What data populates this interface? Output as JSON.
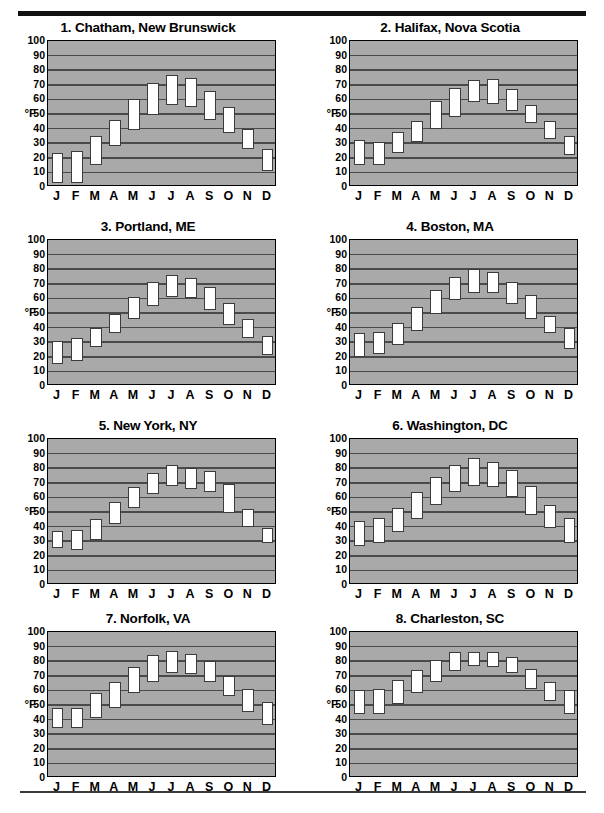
{
  "page": {
    "axis_unit_label": "°F",
    "y_ticks": [
      0,
      10,
      20,
      30,
      40,
      50,
      60,
      70,
      80,
      90,
      100
    ],
    "x_ticks": [
      "J",
      "F",
      "M",
      "A",
      "M",
      "J",
      "J",
      "A",
      "S",
      "O",
      "N",
      "D"
    ],
    "plot_background_color": "#a9a9a9",
    "gridline_color": "#4a4a4a",
    "box_fill_color": "#ffffff",
    "box_border_color": "#3b3b3b",
    "rule_color": "#111111"
  },
  "chart_data": [
    {
      "type": "bar",
      "title": "1. Chatham, New Brunswick",
      "index": 1,
      "xlabel": "",
      "ylabel": "°F",
      "ylim": [
        0,
        100
      ],
      "grid": true,
      "categories": [
        "J",
        "F",
        "M",
        "A",
        "M",
        "J",
        "J",
        "A",
        "S",
        "O",
        "N",
        "D"
      ],
      "series": [
        {
          "name": "low",
          "values": [
            3,
            3,
            15,
            28,
            39,
            49,
            56,
            55,
            46,
            37,
            26,
            11
          ]
        },
        {
          "name": "high",
          "values": [
            23,
            25,
            35,
            46,
            60,
            71,
            77,
            75,
            66,
            55,
            40,
            26
          ]
        }
      ]
    },
    {
      "type": "bar",
      "title": "2. Halifax, Nova Scotia",
      "index": 2,
      "xlabel": "",
      "ylabel": "°F",
      "ylim": [
        0,
        100
      ],
      "grid": true,
      "categories": [
        "J",
        "F",
        "M",
        "A",
        "M",
        "J",
        "J",
        "A",
        "S",
        "O",
        "N",
        "D"
      ],
      "series": [
        {
          "name": "low",
          "values": [
            15,
            15,
            23,
            31,
            40,
            48,
            58,
            57,
            52,
            44,
            33,
            22
          ]
        },
        {
          "name": "high",
          "values": [
            32,
            31,
            38,
            45,
            59,
            68,
            73,
            74,
            67,
            56,
            45,
            35
          ]
        }
      ]
    },
    {
      "type": "bar",
      "title": "3. Portland, ME",
      "index": 3,
      "xlabel": "",
      "ylabel": "°F",
      "ylim": [
        0,
        100
      ],
      "grid": true,
      "categories": [
        "J",
        "F",
        "M",
        "A",
        "M",
        "J",
        "J",
        "A",
        "S",
        "O",
        "N",
        "D"
      ],
      "series": [
        {
          "name": "low",
          "values": [
            15,
            17,
            27,
            36,
            46,
            55,
            61,
            60,
            52,
            42,
            33,
            21
          ]
        },
        {
          "name": "high",
          "values": [
            31,
            33,
            40,
            49,
            61,
            71,
            76,
            74,
            68,
            57,
            46,
            34
          ]
        }
      ]
    },
    {
      "type": "bar",
      "title": "4. Boston, MA",
      "index": 4,
      "xlabel": "",
      "ylabel": "°F",
      "ylim": [
        0,
        100
      ],
      "grid": true,
      "categories": [
        "J",
        "F",
        "M",
        "A",
        "M",
        "J",
        "J",
        "A",
        "S",
        "O",
        "N",
        "D"
      ],
      "series": [
        {
          "name": "low",
          "values": [
            20,
            22,
            28,
            38,
            49,
            59,
            64,
            64,
            56,
            46,
            36,
            25
          ]
        },
        {
          "name": "high",
          "values": [
            36,
            37,
            43,
            54,
            66,
            75,
            80,
            78,
            71,
            62,
            48,
            40
          ]
        }
      ]
    },
    {
      "type": "bar",
      "title": "5. New York, NY",
      "index": 5,
      "xlabel": "",
      "ylabel": "°F",
      "ylim": [
        0,
        100
      ],
      "grid": true,
      "categories": [
        "J",
        "F",
        "M",
        "A",
        "M",
        "J",
        "J",
        "A",
        "S",
        "O",
        "N",
        "D"
      ],
      "series": [
        {
          "name": "low",
          "values": [
            25,
            24,
            31,
            42,
            53,
            62,
            68,
            66,
            64,
            49,
            40,
            29
          ]
        },
        {
          "name": "high",
          "values": [
            37,
            38,
            45,
            57,
            67,
            77,
            82,
            80,
            78,
            69,
            52,
            39
          ]
        }
      ]
    },
    {
      "type": "bar",
      "title": "6. Washington, DC",
      "index": 6,
      "xlabel": "",
      "ylabel": "°F",
      "ylim": [
        0,
        100
      ],
      "grid": true,
      "categories": [
        "J",
        "F",
        "M",
        "A",
        "M",
        "J",
        "J",
        "A",
        "S",
        "O",
        "N",
        "D"
      ],
      "series": [
        {
          "name": "low",
          "values": [
            27,
            29,
            36,
            45,
            55,
            64,
            68,
            67,
            60,
            48,
            39,
            29
          ]
        },
        {
          "name": "high",
          "values": [
            44,
            46,
            53,
            64,
            74,
            82,
            87,
            84,
            79,
            68,
            55,
            46
          ]
        }
      ]
    },
    {
      "type": "bar",
      "title": "7. Norfolk, VA",
      "index": 7,
      "xlabel": "",
      "ylabel": "°F",
      "ylim": [
        0,
        100
      ],
      "grid": true,
      "categories": [
        "J",
        "F",
        "M",
        "A",
        "M",
        "J",
        "J",
        "A",
        "S",
        "O",
        "N",
        "D"
      ],
      "series": [
        {
          "name": "low",
          "values": [
            34,
            34,
            41,
            48,
            58,
            66,
            72,
            71,
            66,
            56,
            45,
            36
          ]
        },
        {
          "name": "high",
          "values": [
            48,
            48,
            58,
            66,
            76,
            84,
            87,
            85,
            80,
            70,
            61,
            52
          ]
        }
      ]
    },
    {
      "type": "bar",
      "title": "8. Charleston, SC",
      "index": 8,
      "xlabel": "",
      "ylabel": "°F",
      "ylim": [
        0,
        100
      ],
      "grid": true,
      "categories": [
        "J",
        "F",
        "M",
        "A",
        "M",
        "J",
        "J",
        "A",
        "S",
        "O",
        "N",
        "D"
      ],
      "series": [
        {
          "name": "low",
          "values": [
            44,
            44,
            51,
            58,
            66,
            73,
            77,
            76,
            72,
            61,
            53,
            44
          ]
        },
        {
          "name": "high",
          "values": [
            60,
            61,
            67,
            74,
            81,
            86,
            86,
            86,
            83,
            75,
            66,
            60
          ]
        }
      ]
    }
  ]
}
